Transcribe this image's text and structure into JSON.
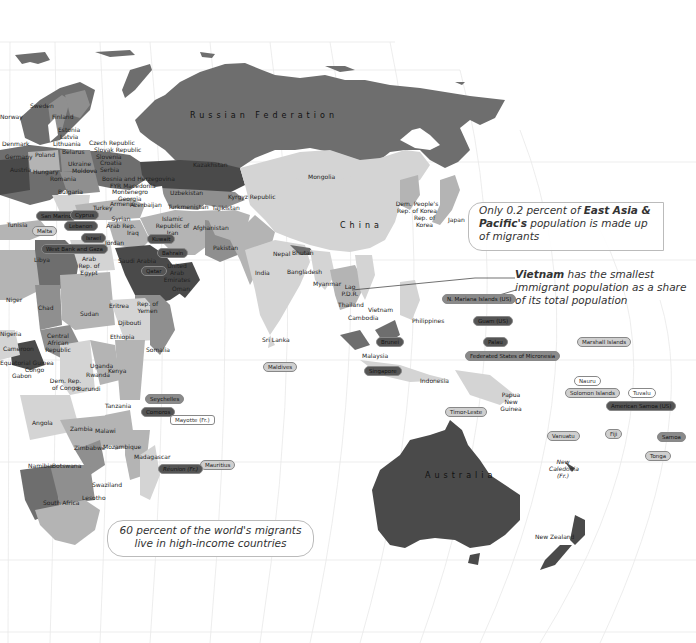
{
  "map": {
    "theme": "International migrants as share of population — Eastern hemisphere",
    "colors": {
      "background": "#ffffff",
      "graticule": "#e6e6e6",
      "very_high": "#4a4a4a",
      "high": "#6e6e6e",
      "medium": "#8f8f8f",
      "low": "#b4b4b4",
      "very_low": "#d4d4d4"
    },
    "region_labels": {
      "russia": "Russian Federation",
      "china": "China",
      "australia": "Australia"
    },
    "country_labels": {
      "norway": "Norway",
      "sweden": "Sweden",
      "finland": "Finland",
      "estonia": "Estonia",
      "latvia": "Latvia",
      "lithuania": "Lithuania",
      "denmark": "Denmark",
      "germany": "Germany",
      "poland": "Poland",
      "belarus": "Belarus",
      "czech": "Czech Republic",
      "slovakia": "Slovak Republic",
      "slovenia": "Slovenia",
      "croatia": "Croatia",
      "serbia": "Serbia",
      "ukraine": "Ukraine",
      "moldova": "Moldova",
      "austria": "Austria",
      "hungary": "Hungary",
      "romania": "Romania",
      "bulgaria": "Bulgaria",
      "bosnia": "Bosnia and Herzegovina",
      "macedonia": "FYR Macedonia",
      "montenegro": "Montenegro",
      "georgia": "Georgia",
      "armenia": "Armenia",
      "azerbaijan": "Azerbaijan",
      "turkey": "Turkey",
      "kazakhstan": "Kazakhstan",
      "uzbekistan": "Uzbekistan",
      "turkmenistan": "Turkmenistan",
      "kyrgyz": "Kyrgyz Republic",
      "tajikistan": "Tajikistan",
      "mongolia": "Mongolia",
      "dprk": "Dem. People's Rep. of Korea",
      "korea": "Rep. of Korea",
      "japan": "Japan",
      "iran": "Islamic Republic of Iran",
      "afghanistan": "Afghanistan",
      "pakistan": "Pakistan",
      "nepal": "Nepal",
      "bhutan": "Bhutan",
      "india": "India",
      "bangladesh": "Bangladesh",
      "myanmar": "Myanmar",
      "laos": "Lao P.D.R.",
      "thailand": "Thailand",
      "cambodia": "Cambodia",
      "vietnam": "Vietnam",
      "philippines": "Philippines",
      "malaysia": "Malaysia",
      "indonesia": "Indonesia",
      "png": "Papua New Guinea",
      "srilanka": "Sri Lanka",
      "syria": "Syrian Arab Rep.",
      "iraq": "Iraq",
      "jordan": "Jordan",
      "saudi": "Saudi Arabia",
      "uae": "United Arab Emirates",
      "oman": "Oman",
      "yemen": "Rep. of Yemen",
      "tunisia": "Tunisia",
      "libya": "Libya",
      "egypt": "Arab Rep. of Egypt",
      "niger": "Niger",
      "chad": "Chad",
      "sudan": "Sudan",
      "eritrea": "Eritrea",
      "djibouti": "Djibouti",
      "ethiopia": "Ethiopia",
      "somalia": "Somalia",
      "nigeria": "Nigeria",
      "cameroon": "Cameroon",
      "car": "Central African Republic",
      "eqguinea": "Equatorial Guinea",
      "congo": "Congo",
      "gabon": "Gabon",
      "drc": "Dem. Rep. of Congo",
      "uganda": "Uganda",
      "rwanda": "Rwanda",
      "burundi": "Burundi",
      "kenya": "Kenya",
      "tanzania": "Tanzania",
      "angola": "Angola",
      "zambia": "Zambia",
      "malawi": "Malawi",
      "mozambique": "Mozambique",
      "zimbabwe": "Zimbabwe",
      "namibia": "Namibia",
      "botswana": "Botswana",
      "swaziland": "Swaziland",
      "lesotho": "Lesotho",
      "southafrica": "South Africa",
      "madagascar": "Madagascar",
      "newzealand": "New Zealand",
      "newcaledonia": "New Caledonia (Fr.)"
    },
    "pill_labels": [
      {
        "key": "sanmarino",
        "text": "San Marino",
        "shade": "dark"
      },
      {
        "key": "malta",
        "text": "Malta",
        "shade": "light"
      },
      {
        "key": "cyprus",
        "text": "Cyprus",
        "shade": "dark"
      },
      {
        "key": "lebanon",
        "text": "Lebanon",
        "shade": "dark"
      },
      {
        "key": "israel",
        "text": "Israel",
        "shade": "dark"
      },
      {
        "key": "westbank",
        "text": "West Bank and Gaza",
        "shade": "dark"
      },
      {
        "key": "kuwait",
        "text": "Kuwait",
        "shade": "dark"
      },
      {
        "key": "bahrain",
        "text": "Bahrain",
        "shade": "dark"
      },
      {
        "key": "qatar",
        "text": "Qatar",
        "shade": "dark"
      },
      {
        "key": "maldives",
        "text": "Maldives",
        "shade": "light"
      },
      {
        "key": "brunei",
        "text": "Brunei",
        "shade": "dark"
      },
      {
        "key": "singapore",
        "text": "Singapore",
        "shade": "dark"
      },
      {
        "key": "nmariana",
        "text": "N. Mariana Islands (US)",
        "shade": "mid"
      },
      {
        "key": "guam",
        "text": "Guam (US)",
        "shade": "dark"
      },
      {
        "key": "palau",
        "text": "Palau",
        "shade": "dark"
      },
      {
        "key": "micronesia",
        "text": "Federated States of Micronesia",
        "shade": "mid"
      },
      {
        "key": "marshall",
        "text": "Marshall Islands",
        "shade": "light"
      },
      {
        "key": "nauru",
        "text": "Nauru",
        "shade": "outline"
      },
      {
        "key": "solomon",
        "text": "Solomon Islands",
        "shade": "light"
      },
      {
        "key": "tuvalu",
        "text": "Tuvalu",
        "shade": "outline"
      },
      {
        "key": "amsamoa",
        "text": "American Samoa (US)",
        "shade": "dark"
      },
      {
        "key": "timor",
        "text": "Timor-Leste",
        "shade": "light"
      },
      {
        "key": "vanuatu",
        "text": "Vanuatu",
        "shade": "light"
      },
      {
        "key": "fiji",
        "text": "Fiji",
        "shade": "light"
      },
      {
        "key": "samoa",
        "text": "Samoa",
        "shade": "mid"
      },
      {
        "key": "tonga",
        "text": "Tonga",
        "shade": "light"
      },
      {
        "key": "seychelles",
        "text": "Seychelles",
        "shade": "mid"
      },
      {
        "key": "comoros",
        "text": "Comoros",
        "shade": "dark"
      },
      {
        "key": "mayotte",
        "text": "Mayotte (Fr.)",
        "shade": "outline"
      },
      {
        "key": "mauritius",
        "text": "Mauritius",
        "shade": "light"
      },
      {
        "key": "reunion",
        "text": "Réunion (Fr.)",
        "shade": "dark"
      }
    ],
    "callouts": {
      "east_asia": {
        "prefix": "Only 0.2 percent of ",
        "bold": "East Asia & Pacific's",
        "suffix": " population is made up of migrants"
      },
      "vietnam": {
        "bold": "Vietnam",
        "suffix": " has the smallest immigrant population as a share of its total population"
      },
      "high_income": {
        "line1": "60 percent of the world's migrants",
        "line2": "live in high-income countries"
      }
    }
  }
}
